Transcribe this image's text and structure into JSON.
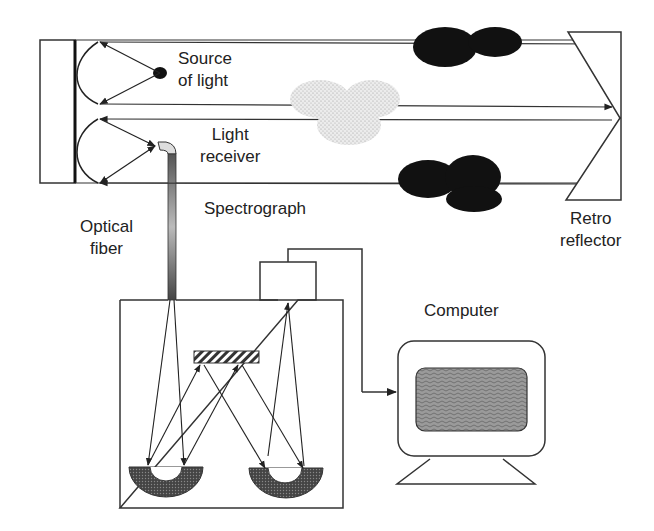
{
  "diagram": {
    "labels": {
      "source_of_light": [
        "Source",
        "of light"
      ],
      "light_receiver": [
        "Light",
        "receiver"
      ],
      "spectrograph": "Spectrograph",
      "optical_fiber": [
        "Optical",
        "fiber"
      ],
      "retro_reflector": [
        "Retro",
        "reflector"
      ],
      "computer": "Computer"
    },
    "components": [
      {
        "id": "telescope",
        "name": "Telescope (source + receiver)"
      },
      {
        "id": "light-source",
        "name": "Source of light"
      },
      {
        "id": "light-receiver",
        "name": "Light receiver"
      },
      {
        "id": "optical-fiber",
        "name": "Optical fiber"
      },
      {
        "id": "retro-reflector",
        "name": "Retro reflector"
      },
      {
        "id": "gas-plumes",
        "name": "Gas clouds in beam path"
      },
      {
        "id": "spectrograph",
        "name": "Spectrograph with grating and two concave mirrors"
      },
      {
        "id": "detector",
        "name": "Detector"
      },
      {
        "id": "computer",
        "name": "Computer"
      }
    ],
    "connections": [
      {
        "from": "light-source",
        "to": "retro-reflector",
        "kind": "light beam"
      },
      {
        "from": "retro-reflector",
        "to": "light-receiver",
        "kind": "light beam"
      },
      {
        "from": "light-receiver",
        "to": "spectrograph",
        "kind": "optical fiber"
      },
      {
        "from": "detector",
        "to": "computer",
        "kind": "data cable"
      }
    ],
    "colors": {
      "line": "#333333",
      "dark_cloud": "#111111",
      "light_cloud": "#d9d9d9",
      "mirror_fill": "#555555",
      "screen_fill": "#8a8a8a"
    }
  }
}
